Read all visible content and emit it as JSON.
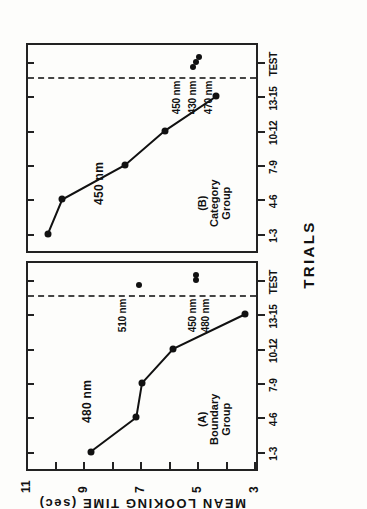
{
  "figure": {
    "xlabel": "TRIALS",
    "ylabel": "MEAN LOOKING TIME (sec)"
  },
  "chart_data": {
    "type": "line",
    "title": "",
    "xlabel": "TRIALS",
    "ylabel": "MEAN LOOKING TIME (sec)",
    "grid": false,
    "legend": "none",
    "ylim": [
      3,
      11
    ],
    "ytick_labels": [
      "11",
      "9",
      "7",
      "5",
      "3"
    ],
    "ytick_values": [
      11,
      9,
      7,
      5,
      3
    ],
    "categories": [
      "1-3",
      "4-6",
      "7-9",
      "10-12",
      "13-15",
      "TEST"
    ],
    "panels": [
      {
        "id": "A",
        "caption_id": "(A)",
        "caption_name": "Boundary",
        "caption_group": "Group",
        "series_label": "480 nm",
        "x": [
          "1-3",
          "4-6",
          "7-9",
          "10-12",
          "13-15"
        ],
        "values": [
          8.8,
          7.2,
          7.0,
          5.9,
          3.4
        ],
        "test_points": [
          {
            "label": "510 nm",
            "value": 7.1
          },
          {
            "label": "450 nm",
            "value": 5.1
          },
          {
            "label": "480 nm",
            "value": 5.1
          }
        ]
      },
      {
        "id": "B",
        "caption_id": "(B)",
        "caption_name": "Category",
        "caption_group": "Group",
        "series_label": "450 nm",
        "x": [
          "1-3",
          "4-6",
          "7-9",
          "10-12",
          "13-15"
        ],
        "values": [
          10.3,
          9.8,
          7.6,
          6.2,
          4.4
        ],
        "test_points": [
          {
            "label": "450 nm",
            "value": 5.2
          },
          {
            "label": "430 nm",
            "value": 5.1
          },
          {
            "label": "470 nm",
            "value": 5.0
          }
        ]
      }
    ]
  }
}
